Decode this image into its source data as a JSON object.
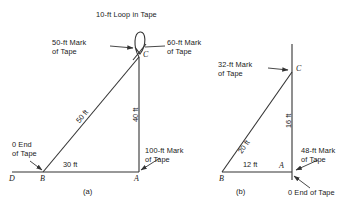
{
  "figure": {
    "title": "10-ft Loop in Tape",
    "caption_a": "(a)",
    "caption_b": "(b)"
  },
  "diagram_a": {
    "vertices": {
      "d": "D",
      "b": "B",
      "a": "A",
      "c": "C"
    },
    "dimensions": {
      "base": "30 ft",
      "hypotenuse": "50 ft",
      "vertical": "40 ft"
    },
    "annotations": {
      "mark_50": "50-ft Mark\nof Tape",
      "mark_60": "60-ft Mark\nof Tape",
      "mark_100": "100-ft Mark\nof Tape",
      "end_0": "0 End\nof Tape"
    }
  },
  "diagram_b": {
    "vertices": {
      "b": "B",
      "a": "A",
      "c": "C"
    },
    "dimensions": {
      "base": "12 ft",
      "hypotenuse": "20 ft",
      "vertical": "16 ft"
    },
    "annotations": {
      "mark_32": "32-ft Mark\nof Tape",
      "mark_48": "48-ft Mark\nof Tape",
      "end_0": "0 End of Tape"
    }
  },
  "colors": {
    "line": "#333333",
    "text": "#1a1a1a",
    "background": "#ffffff"
  }
}
